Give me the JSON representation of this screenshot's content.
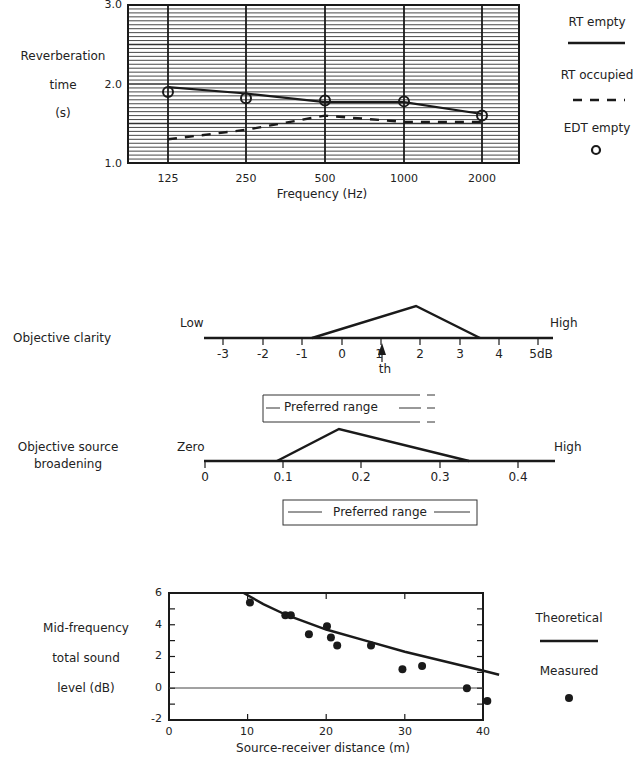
{
  "chart_data": [
    {
      "type": "line",
      "title": "",
      "ylabel": [
        "Reverberation",
        "time",
        "(s)"
      ],
      "xlabel": "Frequency (Hz)",
      "categories": [
        "125",
        "250",
        "500",
        "1000",
        "2000"
      ],
      "yticks": [
        "1.0",
        "2.0",
        "3.0"
      ],
      "ylim": [
        1.0,
        3.0
      ],
      "grid": true,
      "legend_position": "right",
      "series": [
        {
          "name": "RT empty",
          "style": "solid",
          "values": [
            1.96,
            1.88,
            1.77,
            1.77,
            1.62
          ]
        },
        {
          "name": "RT occupied",
          "style": "dashed",
          "values": [
            1.3,
            1.42,
            1.6,
            1.52,
            1.52
          ]
        },
        {
          "name": "EDT empty",
          "style": "circle-markers",
          "values": [
            1.9,
            1.82,
            1.79,
            1.78,
            1.6
          ]
        }
      ]
    },
    {
      "type": "area",
      "title": "Objective clarity",
      "xlabel": "dB",
      "xticks": [
        "-3",
        "-2",
        "-1",
        "0",
        "1",
        "2",
        "3",
        "4",
        "5dB"
      ],
      "xlim": [
        -3.4,
        5.4
      ],
      "end_labels": {
        "left": "Low",
        "right": "High"
      },
      "distribution": {
        "start": -0.7,
        "peak": 1.9,
        "end": 3.5
      },
      "threshold_marker": {
        "label": "th",
        "value": 1.1
      },
      "preferred_range_label": "Preferred range",
      "preferred_range_open_ended": true
    },
    {
      "type": "area",
      "title": "Objective source broadening",
      "xticks": [
        "0",
        "0.1",
        "0.2",
        "0.3",
        "0.4"
      ],
      "xlim": [
        0,
        0.45
      ],
      "end_labels": {
        "left": "Zero",
        "right": "High"
      },
      "distribution": {
        "start": 0.092,
        "peak": 0.17,
        "end": 0.34
      },
      "preferred_range_label": "Preferred range"
    },
    {
      "type": "scatter",
      "title": "",
      "ylabel": [
        "Mid-frequency",
        "total sound",
        "level (dB)"
      ],
      "xlabel": "Source-receiver distance (m)",
      "xticks": [
        "0",
        "10",
        "20",
        "30",
        "40"
      ],
      "yticks": [
        "-2",
        "0",
        "2",
        "4",
        "6"
      ],
      "xlim": [
        0,
        42
      ],
      "ylim": [
        -2,
        6
      ],
      "legend_position": "right",
      "series": [
        {
          "name": "Theoretical",
          "style": "line",
          "x": [
            9.5,
            12,
            15,
            20,
            25,
            30,
            35,
            40,
            42
          ],
          "y": [
            6.0,
            5.3,
            4.6,
            3.7,
            3.0,
            2.3,
            1.7,
            1.1,
            0.85
          ]
        },
        {
          "name": "Measured",
          "style": "dots",
          "x": [
            10.3,
            14.8,
            15.5,
            17.8,
            20.1,
            20.6,
            21.4,
            25.7,
            29.7,
            32.2,
            37.9,
            40.5
          ],
          "y": [
            5.4,
            4.6,
            4.6,
            3.4,
            3.9,
            3.2,
            2.7,
            2.7,
            1.2,
            1.4,
            0.0,
            -0.8
          ]
        }
      ]
    }
  ],
  "rt_chart": {
    "ylabel_lines": [
      "Reverberation",
      "time",
      "(s)"
    ],
    "yticks": [
      "3.0",
      "2.0",
      "1.0"
    ],
    "xticks": [
      "125",
      "250",
      "500",
      "1000",
      "2000"
    ],
    "xlabel": "Frequency (Hz)",
    "legend": {
      "rt_empty": "RT empty",
      "rt_occupied": "RT occupied",
      "edt_empty": "EDT empty"
    }
  },
  "clarity": {
    "title": "Objective clarity",
    "low": "Low",
    "high": "High",
    "ticks": [
      "-3",
      "-2",
      "-1",
      "0",
      "1",
      "2",
      "3",
      "4",
      "5dB"
    ],
    "th": "th",
    "preferred": "Preferred range"
  },
  "broadening": {
    "title_lines": [
      "Objective source",
      "broadening"
    ],
    "low": "Zero",
    "high": "High",
    "ticks": [
      "0",
      "0.1",
      "0.2",
      "0.3",
      "0.4"
    ],
    "preferred": "Preferred range"
  },
  "level_chart": {
    "ylabel_lines": [
      "Mid-frequency",
      "total sound",
      "level (dB)"
    ],
    "yticks": [
      "6",
      "4",
      "2",
      "0",
      "-2"
    ],
    "xticks": [
      "0",
      "10",
      "20",
      "30",
      "40"
    ],
    "xlabel": "Source-receiver distance (m)",
    "legend": {
      "theoretical": "Theoretical",
      "measured": "Measured"
    }
  },
  "colors": {
    "ink": "#1a1a1a",
    "grid": "#333333",
    "background": "#ffffff"
  }
}
